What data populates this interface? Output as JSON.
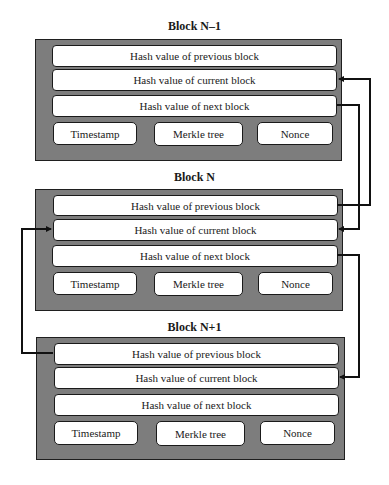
{
  "blocks": [
    {
      "title": "Block N–1",
      "hash_previous": "Hash value of previous block",
      "hash_current": "Hash value of current block",
      "hash_next": "Hash value of next block",
      "timestamp": "Timestamp",
      "merkle_tree": "Merkle tree",
      "nonce": "Nonce"
    },
    {
      "title": "Block N",
      "hash_previous": "Hash value of previous block",
      "hash_current": "Hash value of current block",
      "hash_next": "Hash value of next block",
      "timestamp": "Timestamp",
      "merkle_tree": "Merkle tree",
      "nonce": "Nonce"
    },
    {
      "title": "Block N+1",
      "hash_previous": "Hash value of previous block",
      "hash_current": "Hash value of current block",
      "hash_next": "Hash value of next block",
      "timestamp": "Timestamp",
      "merkle_tree": "Merkle tree",
      "nonce": "Nonce"
    }
  ],
  "connections": [
    {
      "from": "Block N – Hash value of previous block",
      "to": "Block N–1 – Hash value of current block"
    },
    {
      "from": "Block N–1 – Hash value of next block",
      "to": "Block N – Hash value of current block"
    },
    {
      "from": "Block N – Hash value of next block",
      "to": "Block N+1 – Hash value of current block"
    },
    {
      "from": "Block N+1 – Hash value of previous block",
      "to": "Block N – Hash value of current block"
    }
  ],
  "colors": {
    "block_fill": "#7d7d7d",
    "field_fill": "#ffffff",
    "line": "#111111"
  }
}
